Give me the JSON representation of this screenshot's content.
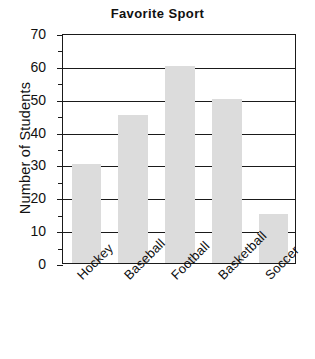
{
  "chart_data": {
    "type": "bar",
    "title": "Favorite Sport",
    "xlabel": "",
    "ylabel": "Number of Students",
    "categories": [
      "Hockey",
      "Baseball",
      "Football",
      "Basketball",
      "Soccer"
    ],
    "values": [
      30,
      45,
      60,
      50,
      15
    ],
    "ylim": [
      0,
      70
    ],
    "y_major_ticks": [
      0,
      10,
      20,
      30,
      40,
      50,
      60,
      70
    ],
    "y_minor_ticks": [
      5,
      15,
      25,
      35,
      45,
      55,
      65
    ],
    "y_tick_labels": [
      "0",
      "10",
      "20",
      "30",
      "40",
      "50",
      "60",
      "70"
    ],
    "grid": "horizontal",
    "legend": "none",
    "bar_color": "#dcdcdc",
    "axis_color": "#1a1a1a",
    "background_color": "#ffffff"
  }
}
